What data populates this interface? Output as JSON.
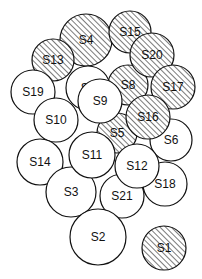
{
  "diagram": {
    "circles": [
      {
        "id": "S4",
        "x": 86,
        "y": 40,
        "r": 26,
        "hatched": true
      },
      {
        "id": "S15",
        "x": 130,
        "y": 32,
        "r": 21,
        "hatched": true
      },
      {
        "id": "S13",
        "x": 53,
        "y": 60,
        "r": 21,
        "hatched": true
      },
      {
        "id": "S7",
        "x": 88,
        "y": 88,
        "r": 22,
        "hatched": false
      },
      {
        "id": "S8",
        "x": 128,
        "y": 85,
        "r": 20,
        "hatched": true
      },
      {
        "id": "S20",
        "x": 152,
        "y": 55,
        "r": 22,
        "hatched": true
      },
      {
        "id": "S17",
        "x": 173,
        "y": 87,
        "r": 22,
        "hatched": true
      },
      {
        "id": "S19",
        "x": 33,
        "y": 92,
        "r": 22,
        "hatched": false
      },
      {
        "id": "S10",
        "x": 56,
        "y": 120,
        "r": 22,
        "hatched": false
      },
      {
        "id": "S5",
        "x": 117,
        "y": 133,
        "r": 20,
        "hatched": true
      },
      {
        "id": "S6",
        "x": 171,
        "y": 140,
        "r": 21,
        "hatched": false
      },
      {
        "id": "S16",
        "x": 148,
        "y": 117,
        "r": 22,
        "hatched": true
      },
      {
        "id": "S9",
        "x": 100,
        "y": 101,
        "r": 22,
        "hatched": false
      },
      {
        "id": "S14",
        "x": 40,
        "y": 162,
        "r": 23,
        "hatched": false
      },
      {
        "id": "S3",
        "x": 71,
        "y": 192,
        "r": 25,
        "hatched": false
      },
      {
        "id": "S18",
        "x": 165,
        "y": 184,
        "r": 22,
        "hatched": false
      },
      {
        "id": "S21",
        "x": 122,
        "y": 196,
        "r": 22,
        "hatched": false
      },
      {
        "id": "S11",
        "x": 92,
        "y": 155,
        "r": 23,
        "hatched": false
      },
      {
        "id": "S12",
        "x": 137,
        "y": 166,
        "r": 22,
        "hatched": false
      },
      {
        "id": "S2",
        "x": 98,
        "y": 237,
        "r": 28,
        "hatched": false
      },
      {
        "id": "S1",
        "x": 164,
        "y": 248,
        "r": 22,
        "hatched": true
      }
    ],
    "colors": {
      "stroke": "#111111",
      "fill": "#ffffff",
      "hatch": "#333333"
    }
  }
}
